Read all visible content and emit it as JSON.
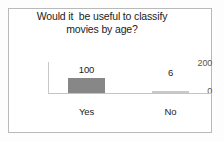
{
  "chart_data": {
    "type": "bar",
    "title": "Would it  be useful to classify\nmovies by age?",
    "title_line1": "Would it  be useful to classify",
    "title_line2": "movies by age?",
    "categories": [
      "Yes",
      "No"
    ],
    "values": [
      100,
      6
    ],
    "data_labels": [
      "100",
      "6"
    ],
    "xlabel": "",
    "ylabel": "",
    "ylim": [
      0,
      200
    ],
    "yticks": [
      200,
      0
    ],
    "ytick_labels": [
      "200",
      "0"
    ],
    "grid": false,
    "legend": false,
    "legend_position": "none",
    "series": [
      {
        "name": "",
        "values": [
          100,
          6
        ],
        "color": "#878787"
      }
    ],
    "colors": {
      "bar_yes": "#878787",
      "bar_no": "#c9c9c9",
      "axis": "#c4c4c4",
      "text": "#1b1b1b",
      "tick_text": "#555555",
      "frame_border": "#b9b9b9",
      "background": "#ffffff"
    }
  }
}
